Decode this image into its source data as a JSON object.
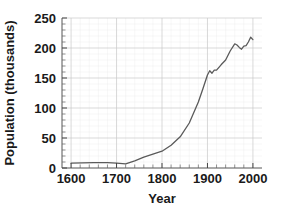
{
  "chart_data": {
    "type": "line",
    "title": "",
    "xlabel": "Year",
    "ylabel": "Population (thousands)",
    "xlim": [
      1580,
      2020
    ],
    "ylim": [
      0,
      250
    ],
    "grid": true,
    "legend": "none",
    "x_ticks": [
      1600,
      1700,
      1800,
      1900,
      2000
    ],
    "x_tick_labels": [
      "1600",
      "1700",
      "1800",
      "1900",
      "2000"
    ],
    "x_minor_step": 20,
    "y_ticks": [
      0,
      50,
      100,
      150,
      200,
      250
    ],
    "y_tick_labels": [
      "0",
      "50",
      "100",
      "150",
      "200",
      "250"
    ],
    "y_minor_step": 10,
    "series": [
      {
        "name": "Population",
        "color": "#5a5a5a",
        "x": [
          1600,
          1650,
          1680,
          1700,
          1720,
          1740,
          1760,
          1780,
          1800,
          1820,
          1840,
          1860,
          1880,
          1890,
          1900,
          1905,
          1910,
          1915,
          1920,
          1930,
          1940,
          1950,
          1960,
          1965,
          1970,
          1975,
          1980,
          1985,
          1990,
          1995,
          2000
        ],
        "y": [
          8,
          9,
          9,
          8,
          7,
          12,
          18,
          23,
          28,
          38,
          52,
          75,
          110,
          132,
          155,
          162,
          158,
          163,
          163,
          172,
          180,
          195,
          207,
          205,
          201,
          198,
          203,
          204,
          210,
          218,
          214
        ]
      }
    ]
  },
  "axes": {
    "x_axis_name": "year-axis",
    "y_axis_name": "population-axis"
  }
}
